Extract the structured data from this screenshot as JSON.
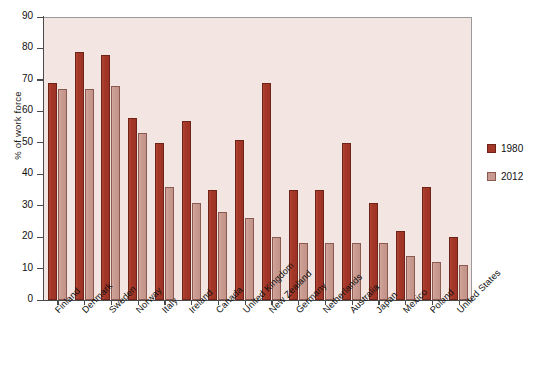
{
  "chart_data": {
    "type": "bar",
    "title": "",
    "xlabel": "",
    "ylabel": "% of work force",
    "ylim": [
      0,
      90
    ],
    "ytick_values": [
      0,
      10,
      20,
      30,
      40,
      50,
      60,
      70,
      80,
      90
    ],
    "ytick_labels": [
      "0",
      "10",
      "20",
      "30",
      "40",
      "50",
      "60",
      "70",
      "80",
      "90"
    ],
    "grid": false,
    "legend_position": "right",
    "categories": [
      "Finland",
      "Denmark",
      "Sweden",
      "Norway",
      "Italy",
      "Ireland",
      "Canada",
      "United Kingdom",
      "New Zealand",
      "Germany",
      "Netherlands",
      "Australia",
      "Japan",
      "Mexico",
      "Poland",
      "United States"
    ],
    "series": [
      {
        "name": "1980",
        "color": "#a43728",
        "values": [
          69,
          79,
          78,
          58,
          50,
          57,
          35,
          51,
          69,
          35,
          35,
          50,
          31,
          22,
          36,
          20
        ]
      },
      {
        "name": "2012",
        "color": "#c89a90",
        "values": [
          67,
          67,
          68,
          53,
          36,
          31,
          28,
          26,
          20,
          18,
          18,
          18,
          18,
          14,
          12,
          11
        ]
      }
    ]
  },
  "legend": {
    "entries": [
      {
        "label": "1980"
      },
      {
        "label": "2012"
      }
    ]
  },
  "colors": {
    "series_1980": "#a43728",
    "series_2012": "#c89a90",
    "plot_background": "#f3e6e2",
    "axis": "#4a4a4a",
    "text": "#111111"
  }
}
